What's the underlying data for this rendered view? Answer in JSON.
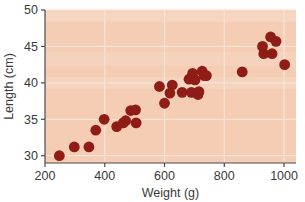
{
  "chart_data": {
    "type": "scatter",
    "title": "",
    "xlabel": "Weight (g)",
    "ylabel": "Length (cm)",
    "xlim": [
      200,
      1040
    ],
    "ylim": [
      29,
      50
    ],
    "xticks": [
      200,
      400,
      600,
      800,
      1000
    ],
    "yticks": [
      30,
      35,
      40,
      45,
      50
    ],
    "xtick_labels": [
      "200",
      "400",
      "600",
      "800",
      "1000"
    ],
    "ytick_labels": [
      "30",
      "35",
      "40",
      "45",
      "50"
    ],
    "grid": true,
    "grid_color": "#f7e4d8",
    "legend": null,
    "plot_background": "#f4cdb4",
    "figure_background": "#ffffff",
    "marker_color": "#8f1d16",
    "marker_size": 5.4,
    "series": [
      {
        "name": "fish",
        "points": [
          [
            248,
            30.0
          ],
          [
            298,
            31.2
          ],
          [
            347,
            31.2
          ],
          [
            370,
            33.5
          ],
          [
            398,
            35.0
          ],
          [
            440,
            34.0
          ],
          [
            462,
            34.5
          ],
          [
            470,
            34.8
          ],
          [
            487,
            36.2
          ],
          [
            503,
            36.3
          ],
          [
            505,
            34.5
          ],
          [
            583,
            39.5
          ],
          [
            600,
            37.2
          ],
          [
            618,
            38.6
          ],
          [
            626,
            39.7
          ],
          [
            659,
            38.7
          ],
          [
            682,
            40.5
          ],
          [
            690,
            38.7
          ],
          [
            694,
            41.3
          ],
          [
            702,
            40.4
          ],
          [
            712,
            38.4
          ],
          [
            715,
            38.8
          ],
          [
            726,
            41.6
          ],
          [
            733,
            41.0
          ],
          [
            740,
            41.0
          ],
          [
            860,
            41.5
          ],
          [
            928,
            45.0
          ],
          [
            932,
            44.0
          ],
          [
            955,
            46.3
          ],
          [
            960,
            44.0
          ],
          [
            973,
            45.7
          ],
          [
            1002,
            42.5
          ]
        ]
      }
    ]
  },
  "axes": {
    "x_title": "Weight (g)",
    "y_title": "Length (cm)"
  }
}
